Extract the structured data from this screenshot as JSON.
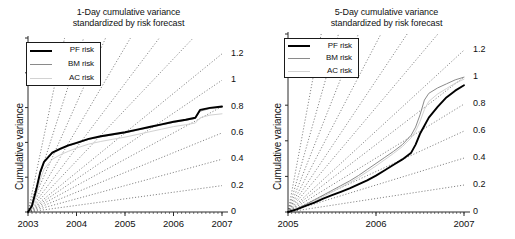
{
  "figure": {
    "width": 515,
    "height": 239,
    "background": "#ffffff"
  },
  "chart_data": [
    {
      "type": "line",
      "panel": "left",
      "title": "1-Day cumulative variance standardized by risk forecast",
      "title_line1": "1-Day cumulative variance",
      "title_line2": "standardized by risk forecast",
      "xlabel": "",
      "ylabel": "Cumulative variance",
      "x_tick_labels": [
        "2003",
        "2004",
        "2005",
        "2006",
        "2007"
      ],
      "x_tick_values": [
        2003,
        2004,
        2005,
        2006,
        2007
      ],
      "xlim": [
        2003,
        2007
      ],
      "ylim": [
        0,
        1.32
      ],
      "grid": false,
      "right_axis_tick_labels": [
        "1.2",
        "1",
        "0.8",
        "0.6",
        "0.4",
        "0.2",
        "0"
      ],
      "right_axis_tick_values": [
        1.2,
        1.0,
        0.8,
        0.6,
        0.4,
        0.2,
        0
      ],
      "reference_lines_note": "Dotted straight rays fanning from origin to each right-edge label value",
      "legend": {
        "position": "upper-left",
        "entries": [
          {
            "name": "PF risk",
            "color": "#000000",
            "width": 2
          },
          {
            "name": "BM risk",
            "color": "#8a8a8a",
            "width": 1
          },
          {
            "name": "AC risk",
            "color": "#d2d2d2",
            "width": 1
          }
        ]
      },
      "x": [
        2003.0,
        2003.08,
        2003.17,
        2003.25,
        2003.33,
        2003.5,
        2003.67,
        2003.83,
        2004.0,
        2004.25,
        2004.5,
        2004.75,
        2005.0,
        2005.25,
        2005.5,
        2005.75,
        2006.0,
        2006.25,
        2006.45,
        2006.55,
        2006.75,
        2007.0
      ],
      "series": [
        {
          "name": "PF risk",
          "color": "#000000",
          "values": [
            0.0,
            0.045,
            0.17,
            0.3,
            0.38,
            0.45,
            0.48,
            0.505,
            0.525,
            0.555,
            0.575,
            0.59,
            0.605,
            0.625,
            0.645,
            0.665,
            0.685,
            0.7,
            0.715,
            0.775,
            0.79,
            0.8
          ]
        },
        {
          "name": "BM risk",
          "color": "#8a8a8a",
          "values": [
            0.0,
            0.042,
            0.165,
            0.295,
            0.375,
            0.445,
            0.475,
            0.5,
            0.52,
            0.55,
            0.57,
            0.585,
            0.6,
            0.62,
            0.64,
            0.66,
            0.68,
            0.695,
            0.71,
            0.765,
            0.785,
            0.795
          ]
        },
        {
          "name": "AC risk",
          "color": "#d2d2d2",
          "values": [
            0.0,
            0.03,
            0.125,
            0.245,
            0.325,
            0.4,
            0.435,
            0.46,
            0.485,
            0.515,
            0.535,
            0.552,
            0.568,
            0.588,
            0.608,
            0.628,
            0.648,
            0.662,
            0.675,
            0.715,
            0.735,
            0.745
          ]
        }
      ]
    },
    {
      "type": "line",
      "panel": "right",
      "title": "5-Day cumulative variance standardized by risk forecast",
      "title_line1": "5-Day cumulative variance",
      "title_line2": "standardized by risk forecast",
      "xlabel": "",
      "ylabel": "Cumulative variance",
      "x_tick_labels": [
        "2005",
        "2006",
        "2007"
      ],
      "x_tick_values": [
        2005,
        2006,
        2007
      ],
      "xlim": [
        2005,
        2007
      ],
      "ylim": [
        0,
        1.32
      ],
      "grid": false,
      "right_axis_tick_labels": [
        "1.2",
        "1",
        "0.8",
        "0.6",
        "0.4",
        "0.2",
        "0"
      ],
      "right_axis_tick_values": [
        1.2,
        1.0,
        0.8,
        0.6,
        0.4,
        0.2,
        0
      ],
      "reference_lines_note": "Dotted straight rays fanning from origin to each right-edge label value",
      "legend": {
        "position": "upper-left",
        "entries": [
          {
            "name": "PF risk",
            "color": "#000000",
            "width": 2
          },
          {
            "name": "BM risk",
            "color": "#8a8a8a",
            "width": 1
          },
          {
            "name": "AC risk",
            "color": "#d2d2d2",
            "width": 1
          }
        ]
      },
      "x": [
        2005.0,
        2005.1,
        2005.2,
        2005.3,
        2005.4,
        2005.5,
        2005.6,
        2005.7,
        2005.8,
        2005.9,
        2006.0,
        2006.1,
        2006.2,
        2006.3,
        2006.4,
        2006.45,
        2006.5,
        2006.55,
        2006.6,
        2006.7,
        2006.8,
        2006.9,
        2007.0
      ],
      "series": [
        {
          "name": "PF risk",
          "color": "#000000",
          "values": [
            0.0,
            0.02,
            0.045,
            0.07,
            0.1,
            0.125,
            0.15,
            0.175,
            0.205,
            0.235,
            0.27,
            0.31,
            0.35,
            0.39,
            0.44,
            0.5,
            0.58,
            0.64,
            0.7,
            0.78,
            0.85,
            0.9,
            0.94
          ]
        },
        {
          "name": "BM risk",
          "color": "#8a8a8a",
          "values": [
            0.0,
            0.025,
            0.055,
            0.09,
            0.125,
            0.16,
            0.195,
            0.23,
            0.27,
            0.315,
            0.36,
            0.405,
            0.45,
            0.5,
            0.57,
            0.63,
            0.72,
            0.83,
            0.88,
            0.92,
            0.95,
            0.98,
            1.0
          ]
        },
        {
          "name": "AC risk",
          "color": "#d2d2d2",
          "values": [
            0.0,
            0.022,
            0.05,
            0.082,
            0.115,
            0.148,
            0.182,
            0.218,
            0.255,
            0.298,
            0.342,
            0.388,
            0.435,
            0.485,
            0.55,
            0.6,
            0.67,
            0.76,
            0.82,
            0.875,
            0.915,
            0.955,
            0.985
          ]
        }
      ]
    }
  ]
}
